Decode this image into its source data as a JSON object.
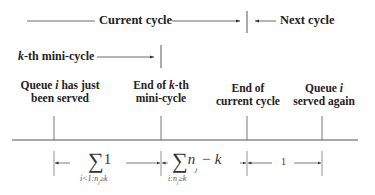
{
  "top_row": {
    "current_cycle_label": "Current cycle",
    "next_cycle_label": "Next cycle"
  },
  "mini_cycle_row": {
    "k_prefix": "k",
    "label_suffix": "-th mini-cycle"
  },
  "event_labels": [
    {
      "line1_a": "Queue ",
      "line1_i": "i",
      "line1_b": " has just",
      "line2": "been served"
    },
    {
      "line1_a": "End of ",
      "line1_k": "k",
      "line1_b": "-th",
      "line2": "mini-cycle"
    },
    {
      "line1": "End of",
      "line2": "current cycle"
    },
    {
      "line1_a": "Queue ",
      "line1_i": "i",
      "line2": "served again"
    }
  ],
  "intervals": [
    {
      "sum_symbol": "∑",
      "summand": "1",
      "subscript": "i<1:n_j≥k",
      "sub_a": "i<1:n",
      "sub_j": "j",
      "sub_b": "≥k"
    },
    {
      "sum_symbol": "∑",
      "summand_n": "n",
      "summand_j": "j",
      "summand_tail": " − k",
      "subscript": "i:n_j≥k",
      "sub_a": "i:n",
      "sub_j": "j",
      "sub_b": "≥k"
    },
    {
      "value": "1"
    }
  ]
}
